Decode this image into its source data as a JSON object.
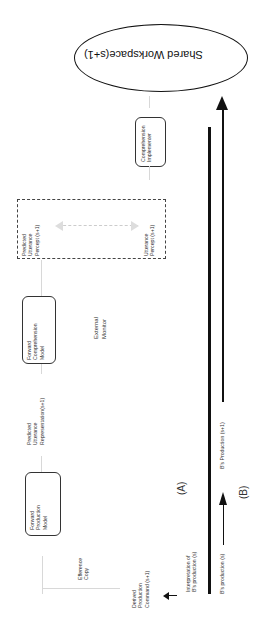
{
  "diagram": {
    "workspace": "Shared Workspace(s+1)",
    "nodes": {
      "forward_production_model": [
        "Forward",
        "Production",
        "Model"
      ],
      "forward_comprehension_model": [
        "Forward",
        "Comprehension",
        "Model"
      ],
      "comprehension_implementer": [
        "Comprehension",
        "Implementer"
      ],
      "predicted_utterance_percept": [
        "Predicted",
        "Utterance",
        "Percept (s+1)"
      ],
      "utterance_percept": [
        "Utterance",
        "Percept (s+1)"
      ]
    },
    "labels": {
      "efference_copy": [
        "Efference",
        "Copy"
      ],
      "predicted_utterance_representation": [
        "Predicted",
        "Utterance",
        "Representation(s+1)"
      ],
      "external_monitor": [
        "External",
        "Monitor"
      ],
      "derived_production_command": [
        "Derived",
        "Production",
        "Command (s+1)"
      ],
      "interpretation": [
        "Interpretation of",
        "B's production (s)"
      ],
      "b_production_s": "B's production (s)",
      "b_production_s1": "B's Production (s+1)",
      "panel_a": "(A)",
      "panel_b": "(B)"
    }
  }
}
